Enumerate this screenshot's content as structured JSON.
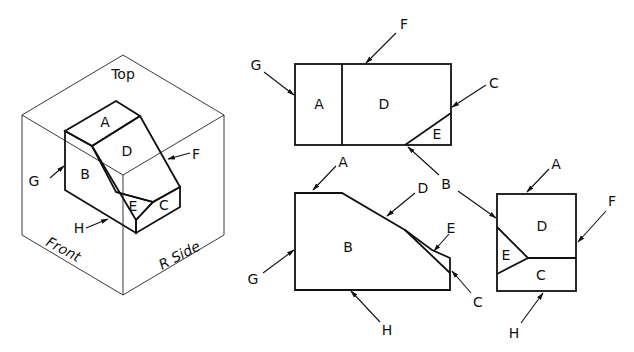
{
  "isometric": {
    "box_labels": {
      "top": "Top",
      "front": "Front",
      "side": "R Side"
    },
    "face_labels": {
      "A": "A",
      "B": "B",
      "C": "C",
      "D": "D",
      "E": "E"
    },
    "edge_labels": {
      "F": "F",
      "G": "G",
      "H": "H"
    }
  },
  "top_view": {
    "face_labels": {
      "A": "A",
      "D": "D",
      "E": "E"
    },
    "edge_labels": {
      "F": "F",
      "G": "G",
      "C": "C"
    }
  },
  "front_view": {
    "face_labels": {
      "B": "B"
    },
    "edge_labels": {
      "A": "A",
      "D": "D",
      "E": "E",
      "G": "G",
      "C": "C",
      "H": "H"
    }
  },
  "side_view": {
    "face_labels": {
      "D": "D",
      "E": "E",
      "C": "C"
    },
    "edge_labels": {
      "A": "A",
      "F": "F",
      "H": "H"
    }
  },
  "shared_label": {
    "B": "B"
  },
  "colors": {
    "line": "#111111",
    "background": "#ffffff"
  }
}
